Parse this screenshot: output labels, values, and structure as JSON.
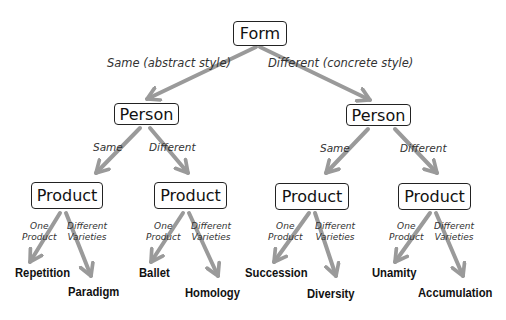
{
  "colors": {
    "arrow": "#9a9a9a",
    "box_border": "#222222",
    "label": "#333333"
  },
  "root": {
    "label": "Form"
  },
  "level1_edges": [
    {
      "label": "Same (abstract style)"
    },
    {
      "label": "Different (concrete style)"
    }
  ],
  "persons": [
    {
      "label": "Person",
      "edges": [
        {
          "label": "Same"
        },
        {
          "label": "Different"
        }
      ],
      "products": [
        {
          "label": "Product",
          "edge_one": "One\nProduct",
          "edge_diff": "Different\nVarieties",
          "leaf_one": "Repetition",
          "leaf_diff": "Paradigm"
        },
        {
          "label": "Product",
          "edge_one": "One\nProduct",
          "edge_diff": "Different\nVarieties",
          "leaf_one": "Ballet",
          "leaf_diff": "Homology"
        }
      ]
    },
    {
      "label": "Person",
      "edges": [
        {
          "label": "Same"
        },
        {
          "label": "Different"
        }
      ],
      "products": [
        {
          "label": "Product",
          "edge_one": "One\nProduct",
          "edge_diff": "Different\nVarieties",
          "leaf_one": "Succession",
          "leaf_diff": "Diversity"
        },
        {
          "label": "Product",
          "edge_one": "One\nProduct",
          "edge_diff": "Different\nVarieties",
          "leaf_one": "Unamity",
          "leaf_diff": "Accumulation"
        }
      ]
    }
  ],
  "edge_label_lines": {
    "one_1": "One",
    "one_2": "Product",
    "diff_1": "Different",
    "diff_2": "Varieties"
  }
}
